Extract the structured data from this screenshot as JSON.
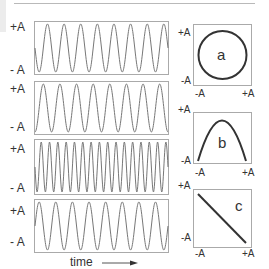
{
  "figure": {
    "time_label": "time",
    "amp_plus": "+A",
    "amp_minus": "- A",
    "xy_plus": "+A",
    "xy_minus": "-A",
    "wave_panels": [
      {
        "id": "w1",
        "cycles": 8,
        "phase_deg": 90,
        "description": "sine, starts at mid rising"
      },
      {
        "id": "w2",
        "cycles": 8,
        "phase_deg": 180,
        "description": "cosine, starts at +A"
      },
      {
        "id": "w3",
        "cycles": 16,
        "phase_deg": 90,
        "description": "double frequency"
      },
      {
        "id": "w4",
        "cycles": 8,
        "phase_deg": 270,
        "description": "inverted sine, starts at mid falling"
      }
    ],
    "xy_panels": [
      {
        "id": "a",
        "label": "a",
        "shape": "circle",
        "description": "90° phase difference"
      },
      {
        "id": "b",
        "label": "b",
        "shape": "parabola",
        "description": "frequency ratio 1:2"
      },
      {
        "id": "c",
        "label": "c",
        "shape": "line-descending",
        "description": "180° phase difference"
      }
    ],
    "colors": {
      "wave": "#777777",
      "xy_curve": "#333333",
      "frame": "#aaaaaa",
      "text": "#333333"
    }
  }
}
